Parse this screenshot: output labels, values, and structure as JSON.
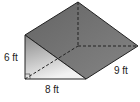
{
  "figure": {
    "type": "triangular-prism",
    "labels": {
      "height": "6 ft",
      "base": "8 ft",
      "length": "9 ft"
    },
    "colors": {
      "front_face_top": "#8a8a8a",
      "front_face_bottom": "#f2f2f2",
      "slanted_face": "#6f6f6f",
      "edge": "#222222"
    }
  }
}
